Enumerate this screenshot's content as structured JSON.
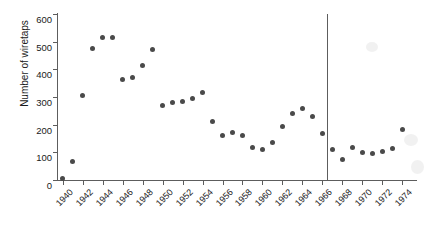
{
  "chart_data": {
    "type": "scatter",
    "title": "",
    "xlabel": "",
    "ylabel": "Number of wiretaps",
    "xlim": [
      1939.5,
      1975.5
    ],
    "ylim": [
      0,
      600
    ],
    "grid": false,
    "legend": null,
    "y_ticks": [
      0,
      100,
      200,
      300,
      400,
      500,
      600
    ],
    "y_tick_labels": [
      "0",
      "100",
      "200",
      "300",
      "400",
      "500",
      "600"
    ],
    "x_ticks": [
      1940,
      1942,
      1944,
      1946,
      1948,
      1950,
      1952,
      1954,
      1956,
      1958,
      1960,
      1962,
      1964,
      1966,
      1968,
      1970,
      1972,
      1974
    ],
    "x_tick_labels": [
      "1940",
      "1942",
      "1944",
      "1946",
      "1948",
      "1950",
      "1952",
      "1954",
      "1956",
      "1958",
      "1960",
      "1962",
      "1964",
      "1966",
      "1968",
      "1970",
      "1972",
      "1974"
    ],
    "x": [
      1940,
      1941,
      1942,
      1943,
      1944,
      1945,
      1946,
      1947,
      1948,
      1949,
      1950,
      1951,
      1952,
      1953,
      1954,
      1955,
      1956,
      1957,
      1958,
      1959,
      1960,
      1961,
      1962,
      1963,
      1964,
      1965,
      1966,
      1967,
      1968,
      1969,
      1970,
      1971,
      1972,
      1973,
      1974
    ],
    "values": [
      4,
      68,
      304,
      475,
      515,
      516,
      362,
      372,
      415,
      470,
      268,
      280,
      282,
      296,
      318,
      211,
      161,
      170,
      162,
      117,
      111,
      136,
      194,
      240,
      257,
      229,
      167,
      109,
      75,
      116,
      98,
      95,
      102,
      115,
      182
    ],
    "points": [
      {
        "x": 1940,
        "y": 4
      },
      {
        "x": 1941,
        "y": 68
      },
      {
        "x": 1942,
        "y": 304
      },
      {
        "x": 1943,
        "y": 475
      },
      {
        "x": 1944,
        "y": 515
      },
      {
        "x": 1945,
        "y": 516
      },
      {
        "x": 1946,
        "y": 362
      },
      {
        "x": 1947,
        "y": 372
      },
      {
        "x": 1948,
        "y": 415
      },
      {
        "x": 1949,
        "y": 470
      },
      {
        "x": 1950,
        "y": 268
      },
      {
        "x": 1951,
        "y": 280
      },
      {
        "x": 1952,
        "y": 282
      },
      {
        "x": 1953,
        "y": 296
      },
      {
        "x": 1954,
        "y": 318
      },
      {
        "x": 1955,
        "y": 211
      },
      {
        "x": 1956,
        "y": 161
      },
      {
        "x": 1957,
        "y": 170
      },
      {
        "x": 1958,
        "y": 162
      },
      {
        "x": 1959,
        "y": 117
      },
      {
        "x": 1960,
        "y": 111
      },
      {
        "x": 1961,
        "y": 136
      },
      {
        "x": 1962,
        "y": 194
      },
      {
        "x": 1963,
        "y": 240
      },
      {
        "x": 1964,
        "y": 257
      },
      {
        "x": 1965,
        "y": 229
      },
      {
        "x": 1966,
        "y": 167
      },
      {
        "x": 1967,
        "y": 109
      },
      {
        "x": 1968,
        "y": 75
      },
      {
        "x": 1969,
        "y": 116
      },
      {
        "x": 1970,
        "y": 98
      },
      {
        "x": 1971,
        "y": 95
      },
      {
        "x": 1972,
        "y": 102
      },
      {
        "x": 1973,
        "y": 115
      },
      {
        "x": 1974,
        "y": 182
      }
    ],
    "annotations": [
      {
        "type": "vline",
        "x": 1966.5,
        "label": ""
      }
    ],
    "marker_color": "#4a4a4a",
    "axis_color": "#5d5d5d"
  }
}
